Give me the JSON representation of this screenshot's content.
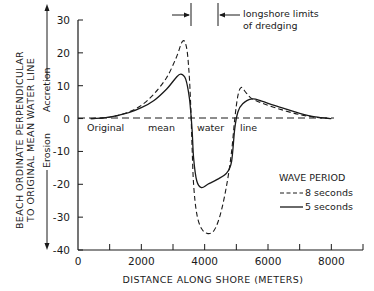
{
  "chart_data": {
    "type": "line",
    "title": "",
    "xlabel": "DISTANCE ALONG SHORE (METERS)",
    "ylabel_line1": "BEACH ORDINATE PERPENDICULAR",
    "ylabel_line2": "TO ORIGINAL MEAN WATER LINE",
    "xlim": [
      0,
      9000
    ],
    "ylim": [
      -40,
      30
    ],
    "x_ticks": [
      0,
      1000,
      2000,
      3000,
      4000,
      5000,
      6000,
      7000,
      8000,
      9000
    ],
    "x_tick_labels": [
      "0",
      "2000",
      "4000",
      "6000",
      "8000"
    ],
    "x_tick_label_values": [
      0,
      2000,
      4000,
      6000,
      8000
    ],
    "y_ticks": [
      30,
      20,
      10,
      0,
      -10,
      -20,
      -30,
      -40
    ],
    "y_tick_labels": [
      "30",
      "20",
      "10",
      "0",
      "-10",
      "-20",
      "-30",
      "-40"
    ],
    "grid": false,
    "legend": {
      "title": "WAVE PERIOD",
      "position": "lower right",
      "entries": [
        {
          "label": "8 seconds",
          "style": "dashed"
        },
        {
          "label": "5 seconds",
          "style": "solid"
        }
      ]
    },
    "annotations": {
      "accretion": "Accretion",
      "erosion": "Erosion",
      "baseline_label": [
        "Original",
        "mean",
        "water",
        "line"
      ],
      "dredging_line1": "longshore limits",
      "dredging_line2": "of dredging",
      "dredging_limits_x": [
        3550,
        4400
      ]
    },
    "series": [
      {
        "name": "8 seconds",
        "style": "dashed",
        "points": [
          [
            400,
            0
          ],
          [
            800,
            0.2
          ],
          [
            1200,
            0.8
          ],
          [
            1600,
            2
          ],
          [
            2000,
            4
          ],
          [
            2400,
            7.5
          ],
          [
            2800,
            12.5
          ],
          [
            3100,
            18.5
          ],
          [
            3300,
            23.5
          ],
          [
            3420,
            22
          ],
          [
            3500,
            15
          ],
          [
            3560,
            4
          ],
          [
            3600,
            -8
          ],
          [
            3650,
            -20
          ],
          [
            3750,
            -29
          ],
          [
            3900,
            -33.5
          ],
          [
            4100,
            -35
          ],
          [
            4300,
            -34
          ],
          [
            4500,
            -29
          ],
          [
            4700,
            -20
          ],
          [
            4850,
            -10
          ],
          [
            4950,
            0
          ],
          [
            5050,
            7
          ],
          [
            5150,
            9.5
          ],
          [
            5300,
            8
          ],
          [
            5500,
            6
          ],
          [
            6000,
            4
          ],
          [
            6500,
            2.5
          ],
          [
            7000,
            1.2
          ],
          [
            7500,
            0.4
          ],
          [
            8000,
            0
          ]
        ]
      },
      {
        "name": "5 seconds",
        "style": "solid",
        "points": [
          [
            400,
            0
          ],
          [
            800,
            0.2
          ],
          [
            1200,
            0.8
          ],
          [
            1600,
            1.8
          ],
          [
            2000,
            3.3
          ],
          [
            2400,
            5.5
          ],
          [
            2800,
            9
          ],
          [
            3100,
            12.5
          ],
          [
            3250,
            13.5
          ],
          [
            3400,
            12
          ],
          [
            3520,
            6
          ],
          [
            3600,
            -3
          ],
          [
            3650,
            -12
          ],
          [
            3750,
            -19
          ],
          [
            3900,
            -21
          ],
          [
            4100,
            -20
          ],
          [
            4400,
            -18.5
          ],
          [
            4700,
            -16.5
          ],
          [
            4850,
            -13
          ],
          [
            4950,
            -3
          ],
          [
            5050,
            2
          ],
          [
            5200,
            4.5
          ],
          [
            5500,
            6
          ],
          [
            5800,
            5.3
          ],
          [
            6200,
            4
          ],
          [
            6600,
            2.8
          ],
          [
            7000,
            1.6
          ],
          [
            7500,
            0.5
          ],
          [
            8000,
            0
          ]
        ]
      }
    ]
  }
}
